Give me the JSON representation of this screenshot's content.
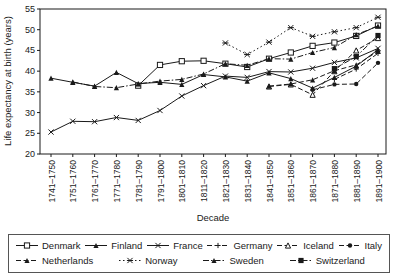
{
  "chart_data": {
    "type": "line",
    "title": "",
    "xlabel": "Decade",
    "ylabel": "Life expectancy at birth (years)",
    "ylim": [
      20,
      55
    ],
    "yticks": [
      20,
      25,
      30,
      35,
      40,
      45,
      50,
      55
    ],
    "grid": false,
    "legend_position": "bottom-box",
    "line_color": "#1a1a1a",
    "categories": [
      "1741–1750",
      "1751–1760",
      "1761–1770",
      "1771–1780",
      "1781–1790",
      "1791–1800",
      "1801–1810",
      "1811–1820",
      "1821–1830",
      "1831–1840",
      "1841–1850",
      "1851–1860",
      "1861–1870",
      "1871–1880",
      "1881–1890",
      "1891–1900"
    ],
    "series": [
      {
        "name": "Denmark",
        "line": "solid",
        "marker": "square-open",
        "values": [
          null,
          null,
          null,
          null,
          36.5,
          41.5,
          42.4,
          42.5,
          41.8,
          41.0,
          43.0,
          44.5,
          46.1,
          46.9,
          48.5,
          51.0
        ]
      },
      {
        "name": "Finland",
        "line": "solid",
        "marker": "triangle-filled",
        "values": [
          38.3,
          37.3,
          36.4,
          39.7,
          37.0,
          37.3,
          36.8,
          39.2,
          38.6,
          37.6,
          39.6,
          38.2,
          35.9,
          38.5,
          41.2,
          45.2
        ]
      },
      {
        "name": "France",
        "line": "solid",
        "marker": "x",
        "values": [
          25.3,
          27.9,
          27.8,
          28.8,
          28.1,
          30.5,
          34.0,
          36.5,
          38.8,
          38.5,
          39.9,
          39.8,
          40.7,
          42.1,
          43.2,
          45.5
        ]
      },
      {
        "name": "Germany",
        "line": "dashed",
        "marker": "plus",
        "values": [
          null,
          null,
          null,
          null,
          null,
          null,
          null,
          null,
          null,
          null,
          null,
          null,
          null,
          38.0,
          40.5,
          44.3
        ]
      },
      {
        "name": "Iceland",
        "line": "dashed",
        "marker": "triangle-open",
        "values": [
          null,
          null,
          null,
          null,
          null,
          null,
          null,
          null,
          null,
          null,
          36.3,
          36.8,
          34.3,
          40.0,
          45.0,
          48.0
        ]
      },
      {
        "name": "Italy",
        "line": "dashed",
        "marker": "circle-filled",
        "values": [
          null,
          null,
          null,
          null,
          null,
          null,
          null,
          null,
          null,
          null,
          null,
          null,
          35.5,
          36.8,
          36.9,
          42.0
        ]
      },
      {
        "name": "Netherlands",
        "line": "dashed",
        "marker": "triangle-filled",
        "values": [
          null,
          null,
          null,
          null,
          null,
          null,
          null,
          null,
          null,
          null,
          36.4,
          36.9,
          37.9,
          40.1,
          41.5,
          44.8
        ]
      },
      {
        "name": "Norway",
        "line": "dotted",
        "marker": "asterisk",
        "values": [
          null,
          null,
          null,
          null,
          null,
          null,
          null,
          null,
          46.8,
          44.0,
          47.0,
          50.5,
          48.4,
          49.5,
          50.5,
          53.0
        ]
      },
      {
        "name": "Sweden",
        "line": "dashdot",
        "marker": "triangle-filled",
        "values": [
          null,
          37.4,
          36.3,
          36.0,
          36.9,
          37.6,
          38.0,
          39.3,
          41.8,
          41.4,
          43.0,
          42.9,
          44.5,
          45.7,
          48.8,
          50.9
        ]
      },
      {
        "name": "Switzerland",
        "line": "dashdot",
        "marker": "square-filled",
        "values": [
          null,
          null,
          null,
          null,
          null,
          null,
          null,
          null,
          null,
          null,
          null,
          null,
          null,
          40.6,
          43.5,
          48.6
        ]
      }
    ]
  },
  "legend": {
    "rows": [
      [
        "Denmark",
        "Finland",
        "France",
        "Germany",
        "Iceland",
        "Italy"
      ],
      [
        "Netherlands",
        "Norway",
        "Sweden",
        "Switzerland"
      ]
    ]
  }
}
